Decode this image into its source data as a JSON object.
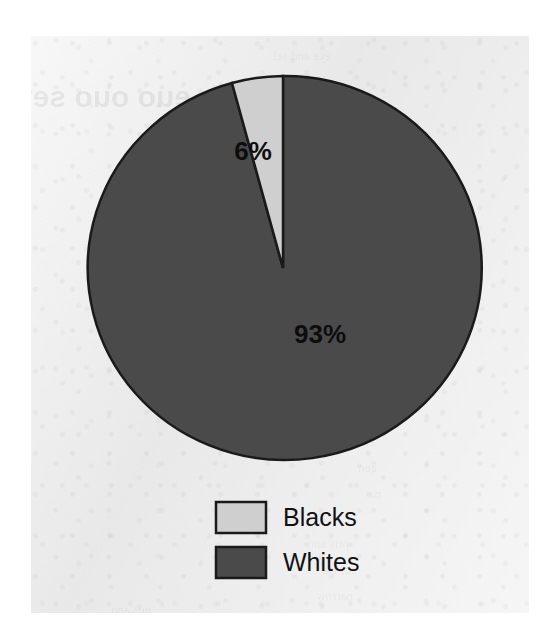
{
  "chart_data": {
    "type": "pie",
    "title": "",
    "categories": [
      "Blacks",
      "Whites"
    ],
    "values": [
      6,
      93
    ],
    "value_labels": [
      "6%",
      "93%"
    ],
    "colors": [
      "#cfcfcf",
      "#4a4a4a"
    ],
    "legend": {
      "position": "bottom",
      "entries": [
        {
          "label": "Blacks",
          "color": "#cfcfcf"
        },
        {
          "label": "Whites",
          "color": "#4a4a4a"
        }
      ]
    },
    "grid": false,
    "xlabel": "",
    "ylabel": ""
  },
  "slices": {
    "blacks": {
      "label": "6%"
    },
    "whites": {
      "label": "93%"
    }
  },
  "legend_items": [
    {
      "label": "Blacks"
    },
    {
      "label": "Whites"
    }
  ],
  "page": {
    "background": "#eeeeee",
    "ghost_lines": [
      {
        "text": "eye and sel",
        "x": 300,
        "y": 12,
        "size": 13
      },
      {
        "text": "euo ouo sef",
        "x": 160,
        "y": 44,
        "size": 30,
        "head": true
      },
      {
        "text": "narrow v",
        "x": 318,
        "y": 60,
        "size": 13
      },
      {
        "text": "the ob",
        "x": 330,
        "y": 86,
        "size": 13
      },
      {
        "text": "that t",
        "x": 334,
        "y": 112,
        "size": 13
      },
      {
        "text": "even",
        "x": 340,
        "y": 138,
        "size": 13
      },
      {
        "text": "one",
        "x": 344,
        "y": 164,
        "size": 13
      },
      {
        "text": "arcs",
        "x": 342,
        "y": 190,
        "size": 13
      },
      {
        "text": "sam",
        "x": 342,
        "y": 216,
        "size": 13
      },
      {
        "text": "the",
        "x": 346,
        "y": 242,
        "size": 13
      },
      {
        "text": "ine",
        "x": 348,
        "y": 268,
        "size": 13
      },
      {
        "text": "cul",
        "x": 348,
        "y": 294,
        "size": 13
      },
      {
        "text": "ot",
        "x": 352,
        "y": 320,
        "size": 13
      },
      {
        "text": "sv",
        "x": 352,
        "y": 346,
        "size": 13
      },
      {
        "text": "cubi",
        "x": 344,
        "y": 372,
        "size": 13
      },
      {
        "text": "erso",
        "x": 344,
        "y": 398,
        "size": 13
      },
      {
        "text": "gen",
        "x": 346,
        "y": 424,
        "size": 13
      },
      {
        "text": "na",
        "x": 350,
        "y": 450,
        "size": 13
      },
      {
        "text": "pris ano",
        "x": 318,
        "y": 500,
        "size": 13
      },
      {
        "text": "cuiona",
        "x": 326,
        "y": 526,
        "size": 13
      },
      {
        "text": "narrow",
        "x": 322,
        "y": 552,
        "size": 13
      },
      {
        "text": "pus ano",
        "x": 120,
        "y": 566,
        "size": 13
      }
    ]
  }
}
